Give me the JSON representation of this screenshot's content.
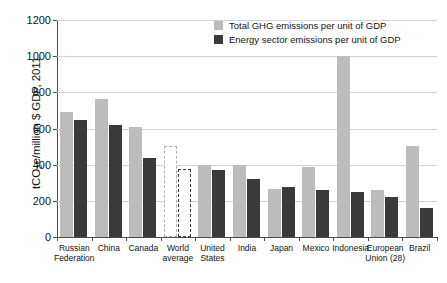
{
  "chart_data": {
    "type": "bar",
    "title": "",
    "subtitle": "",
    "xlabel": "",
    "ylabel": "tCO2e/million $ GDP, 2011",
    "ylabel_parts": {
      "pre": "tCO",
      "sub": "2",
      "post": "e/million $ GDP, 2011"
    },
    "ylim": [
      0,
      1200
    ],
    "yticks": [
      0,
      200,
      400,
      600,
      800,
      1000,
      1200
    ],
    "ytick_labels": [
      "0",
      "200",
      "400",
      "600",
      "800",
      "1000",
      "1200"
    ],
    "grid": true,
    "legend_position": "top-right",
    "categories": [
      "Russian Federation",
      "China",
      "Canada",
      "World average",
      "United States",
      "India",
      "Japan",
      "Mexico",
      "Indonesia",
      "European Union (28)",
      "Brazil"
    ],
    "category_lines": [
      [
        "Russian",
        "Federation"
      ],
      [
        "China"
      ],
      [
        "Canada"
      ],
      [
        "World",
        "average"
      ],
      [
        "United",
        "States"
      ],
      [
        "India"
      ],
      [
        "Japan"
      ],
      [
        "Mexico"
      ],
      [
        "Indonesia"
      ],
      [
        "European",
        "Union (28)"
      ],
      [
        "Brazil"
      ]
    ],
    "series": [
      {
        "name": "Total GHG emissions per unit of GDP",
        "color": "#bcbcbc",
        "values": [
          690,
          762,
          610,
          505,
          397,
          396,
          268,
          388,
          1000,
          258,
          505
        ]
      },
      {
        "name": "Energy sector emissions per unit of GDP",
        "color": "#3a3a3a",
        "values": [
          645,
          622,
          437,
          375,
          368,
          323,
          277,
          262,
          251,
          222,
          160
        ]
      }
    ],
    "outlined_category": "World average"
  },
  "legend": {
    "items": [
      {
        "label": "Total GHG emissions per unit of GDP",
        "swatch": "total"
      },
      {
        "label": "Energy sector emissions per unit of GDP",
        "swatch": "energy"
      }
    ]
  }
}
